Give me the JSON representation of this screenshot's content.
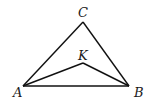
{
  "diagram": {
    "type": "geometry-triangle",
    "points": {
      "A": {
        "x": 23,
        "y": 86,
        "label": "A",
        "label_x": 13,
        "label_y": 97
      },
      "B": {
        "x": 129,
        "y": 86,
        "label": "B",
        "label_x": 134,
        "label_y": 97
      },
      "C": {
        "x": 83,
        "y": 22,
        "label": "C",
        "label_x": 78,
        "label_y": 17
      },
      "K": {
        "x": 83,
        "y": 63,
        "label": "K",
        "label_x": 78,
        "label_y": 60
      }
    },
    "segments": [
      [
        "A",
        "B"
      ],
      [
        "A",
        "C"
      ],
      [
        "B",
        "C"
      ],
      [
        "A",
        "K"
      ],
      [
        "B",
        "K"
      ]
    ],
    "stroke_color": "#111111",
    "background": "#ffffff"
  }
}
